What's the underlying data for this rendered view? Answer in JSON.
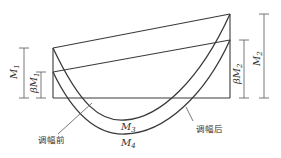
{
  "diagram": {
    "title": "",
    "labels": {
      "m1": {
        "main": "M",
        "sub": "1"
      },
      "beta_m1": {
        "main": "βM",
        "sub": "1"
      },
      "m2": {
        "main": "M",
        "sub": "2"
      },
      "beta_m2": {
        "main": "βM",
        "sub": "2"
      },
      "m3": {
        "main": "M",
        "sub": "3"
      },
      "m4": {
        "main": "M",
        "sub": "4"
      },
      "before_adjust": "调幅前",
      "after_adjust": "调幅后"
    },
    "colors": {
      "line": "#3a3a3a",
      "dimension": "#555555",
      "text": "#333333",
      "background": "#ffffff"
    }
  }
}
